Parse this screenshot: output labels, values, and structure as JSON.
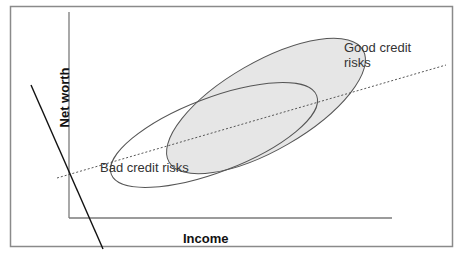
{
  "diagram": {
    "type": "classification-scatter-concept",
    "x_axis_label": "Income",
    "y_axis_label": "Net worth",
    "regions": [
      {
        "name": "good-credit",
        "label": "Good credit risks",
        "label_lines": [
          "Good credit",
          "risks"
        ],
        "fill": "#e6e6e6",
        "stroke": "#555555"
      },
      {
        "name": "bad-credit",
        "label": "Bad credit risks",
        "fill": "none",
        "stroke": "#555555"
      }
    ],
    "lines": [
      {
        "name": "decision-boundary-dashed",
        "style": "dashed",
        "color": "#444444"
      },
      {
        "name": "projection-line-solid",
        "style": "solid",
        "color": "#111111"
      }
    ],
    "frame_color": "#888888",
    "axis_color": "#777777"
  }
}
